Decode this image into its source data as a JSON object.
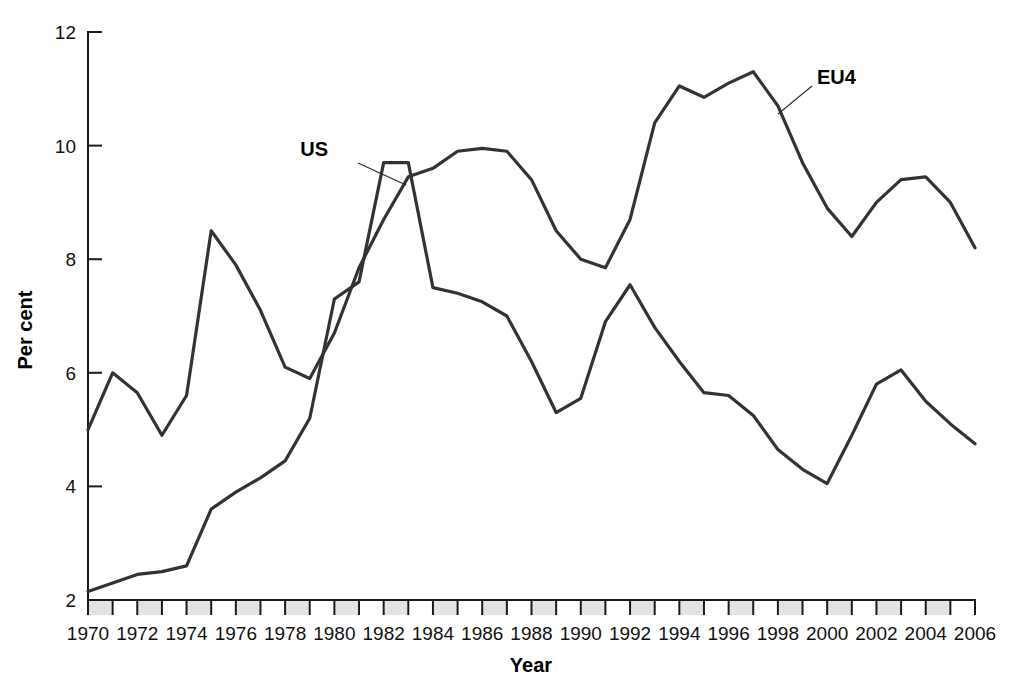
{
  "chart_data": {
    "type": "line",
    "title": "",
    "xlabel": "Year",
    "ylabel": "Per cent",
    "xlim": [
      1970,
      2006
    ],
    "ylim": [
      2,
      12
    ],
    "ytick_labels": [
      "2",
      "4",
      "6",
      "8",
      "10",
      "12"
    ],
    "ytick_values": [
      2,
      4,
      6,
      8,
      10,
      12
    ],
    "xtick_labels": [
      "1970",
      "1972",
      "1974",
      "1976",
      "1978",
      "1980",
      "1982",
      "1984",
      "1986",
      "1988",
      "1990",
      "1992",
      "1994",
      "1996",
      "1998",
      "2000",
      "2002",
      "2004",
      "2006"
    ],
    "xtick_values": [
      1970,
      1972,
      1974,
      1976,
      1978,
      1980,
      1982,
      1984,
      1986,
      1988,
      1990,
      1992,
      1994,
      1996,
      1998,
      2000,
      2002,
      2004,
      2006
    ],
    "grid": false,
    "legend_position": "inline-annotations",
    "x": [
      1970,
      1971,
      1972,
      1973,
      1974,
      1975,
      1976,
      1977,
      1978,
      1979,
      1980,
      1981,
      1982,
      1983,
      1984,
      1985,
      1986,
      1987,
      1988,
      1989,
      1990,
      1991,
      1992,
      1993,
      1994,
      1995,
      1996,
      1997,
      1998,
      1999,
      2000,
      2001,
      2002,
      2003,
      2004,
      2005,
      2006
    ],
    "series": [
      {
        "name": "US",
        "label": "US",
        "color": "#333333",
        "values": [
          2.15,
          2.3,
          2.45,
          2.5,
          2.6,
          3.6,
          3.9,
          4.15,
          4.45,
          5.2,
          7.3,
          7.6,
          9.7,
          9.7,
          7.5,
          7.4,
          7.25,
          7.0,
          6.2,
          5.3,
          5.55,
          6.9,
          7.55,
          6.8,
          6.2,
          5.65,
          5.6,
          5.25,
          4.65,
          4.3,
          4.05,
          4.9,
          5.8,
          6.05,
          5.5,
          5.1,
          4.75
        ]
      },
      {
        "name": "EU4",
        "label": "EU4",
        "color": "#333333",
        "values": [
          5.0,
          6.0,
          5.65,
          4.9,
          5.6,
          8.5,
          7.9,
          7.1,
          6.1,
          5.9,
          6.7,
          7.85,
          8.7,
          9.45,
          9.6,
          9.9,
          9.95,
          9.9,
          9.4,
          8.5,
          8.0,
          7.85,
          8.7,
          10.4,
          11.05,
          10.85,
          11.1,
          11.3,
          10.7,
          9.7,
          8.9,
          8.4,
          9.0,
          9.4,
          9.45,
          9.0,
          8.2
        ]
      }
    ],
    "annotations": [
      {
        "text": "US",
        "x_px": 328,
        "y_px": 156,
        "line_from_x": 358,
        "line_from_y": 163,
        "line_to_x": 406,
        "line_to_y": 185
      },
      {
        "text": "EU4",
        "x_px": 817,
        "y_px": 84,
        "line_from_x": 812,
        "line_from_y": 86,
        "line_to_x": 778,
        "line_to_y": 114
      }
    ]
  },
  "axis": {
    "y_title": "Per cent",
    "x_title": "Year"
  }
}
